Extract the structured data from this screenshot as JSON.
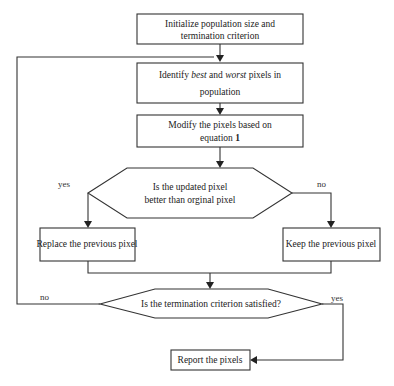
{
  "diagram": {
    "type": "flowchart",
    "nodes": {
      "init": {
        "line1": "Initialize population size and",
        "line2": "termination criterion"
      },
      "identify": {
        "line1_pre": "Identify ",
        "line1_best": "best",
        "line1_mid": " and ",
        "line1_worst": "worst",
        "line1_post": " pixels in",
        "line2": "population"
      },
      "modify": {
        "line1": "Modify the pixels based on",
        "line2_pre": "equation ",
        "line2_num": "1"
      },
      "decision_better": {
        "line1": "Is the updated pixel",
        "line2": "better than orginal pixel"
      },
      "replace": {
        "text": "Replace the previous pixel"
      },
      "keep": {
        "text": "Keep the previous pixel"
      },
      "decision_termination": {
        "text": "Is the termination criterion satisfied?"
      },
      "report": {
        "text": "Report the pixels"
      }
    },
    "edge_labels": {
      "better_yes": "yes",
      "better_no": "no",
      "termination_no": "no",
      "termination_yes": "yes"
    },
    "colors": {
      "stroke": "#333333",
      "text": "#222222",
      "background": "#ffffff"
    }
  }
}
